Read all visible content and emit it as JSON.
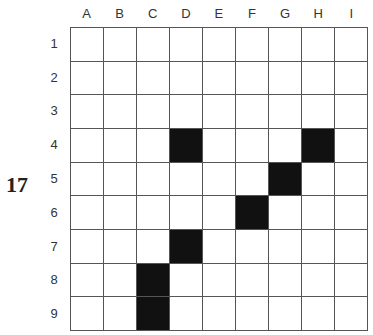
{
  "puzzle_number": "17",
  "columns": [
    "A",
    "B",
    "C",
    "D",
    "E",
    "F",
    "G",
    "H",
    "I"
  ],
  "rows": [
    "1",
    "2",
    "3",
    "4",
    "5",
    "6",
    "7",
    "8",
    "9"
  ],
  "filled_cells": [
    "D4",
    "H4",
    "G5",
    "F6",
    "D7",
    "C8",
    "C9"
  ],
  "colors": {
    "filled": "#111111",
    "empty": "#ffffff",
    "line": "#555555"
  }
}
